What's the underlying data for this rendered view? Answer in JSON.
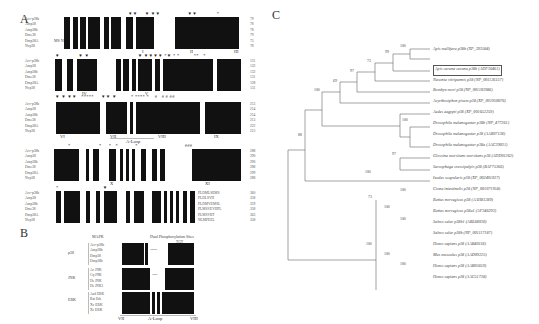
{
  "panels": {
    "A": {
      "letter": "A",
      "blocks": [
        {
          "sequences": [
            "Acc-p38b",
            "Amp38",
            "Amp38b",
            "Dme38",
            "Dmp38A",
            "Nvp38"
          ],
          "end_positions": [
            "79",
            "78",
            "78",
            "79",
            "75",
            "78"
          ],
          "motifs": [
            "I",
            "II",
            "III"
          ],
          "prefix_text": "MS NK"
        },
        {
          "sequences": [
            "Acc-p38b",
            "Amp38",
            "Amp38b",
            "Dme38",
            "Dmp38A",
            "Nvp38"
          ],
          "end_positions": [
            "131",
            "132",
            "132",
            "131",
            "128",
            "131"
          ],
          "motifs": [
            "IV",
            "V"
          ]
        },
        {
          "sequences": [
            "Acc-p38b",
            "Amp38",
            "Amp38b",
            "Dme38",
            "Dmp38A",
            "Nvp38"
          ],
          "end_positions": [
            "213",
            "214",
            "214",
            "213",
            "222",
            "213"
          ],
          "motifs": [
            "VI",
            "VII",
            "A-Loop",
            "VIII",
            "IX"
          ]
        },
        {
          "sequences": [
            "Acc-p38b",
            "Amp38",
            "Amp38b",
            "Dme38",
            "Dmp38A",
            "Nvp38"
          ],
          "end_positions": [
            "288",
            "290",
            "290",
            "288",
            "299",
            "288"
          ],
          "motifs": [
            "X",
            "XI"
          ]
        },
        {
          "sequences": [
            "Acc-p38b",
            "Amp38",
            "Amp38b",
            "Dme38",
            "Dmp38A",
            "Nvp38"
          ],
          "end_positions": [
            "360",
            "358",
            "359",
            "358",
            "363",
            "358"
          ],
          "tail_text": [
            "PLDMLSEMS",
            "PLDLSVH",
            "PLDMVEMSL",
            "PLMSVEVHPL",
            "PLMSVRT",
            "NLMPEEL"
          ]
        }
      ]
    },
    "B": {
      "letter": "B",
      "header_left": "MAPK",
      "header_right": "Dual Phosphorylation Sites",
      "motif_marker": "TGY",
      "groups": [
        {
          "name": "p38",
          "members": [
            "Acc-p38b",
            "Amp38b",
            "Dmp38",
            "Dmp38b"
          ]
        },
        {
          "name": "JNK",
          "members": [
            "Ac JNK",
            "Cq JNK",
            "Hs JNK",
            "Hs JNK1"
          ]
        },
        {
          "name": "ERK",
          "members": [
            "Aad ERK",
            "Rat Erk",
            "Xv ERK",
            "Xc ERK"
          ]
        }
      ],
      "bottom_labels": [
        "VII",
        "A-Loop",
        "VIII"
      ]
    },
    "C": {
      "letter": "C",
      "leaves": [
        {
          "label": "Apis mellifera p38b (XP_393584)",
          "highlight": false
        },
        {
          "label": "Apis cerana cerana p38b (ADF36461)",
          "highlight": true
        },
        {
          "label": "Nasonia vitripennis p38 (NP_001136157)",
          "highlight": false
        },
        {
          "label": "Bombyx mori p38 (NP_001103986)",
          "highlight": false
        },
        {
          "label": "Acyrthosiphon pisum p38 (XP_001950076)",
          "highlight": false
        },
        {
          "label": "Aedes aegypti p38 (XP_001652259)",
          "highlight": false
        },
        {
          "label": "Drosophila melanogaster p38b (NP_477361)",
          "highlight": false
        },
        {
          "label": "Drosophila melanogaster p38 (AAB97138)",
          "highlight": false
        },
        {
          "label": "Drosophila melanogaster p38a (AAC39031)",
          "highlight": false
        },
        {
          "label": "Glossina morsitans morsitans p38 (ADD01362)",
          "highlight": false
        },
        {
          "label": "Sarcophaga crassipalpis p38 (BAF75366)",
          "highlight": false
        },
        {
          "label": "Ixodes scapularis p38 (XP_002401037)",
          "highlight": false
        },
        {
          "label": "Ciona intestinalis p38 (NP_001071958)",
          "highlight": false
        },
        {
          "label": "Rattus norvegicus p38 (AAH81289)",
          "highlight": false
        },
        {
          "label": "Rattus norvegicus p38a1 (AF346293)",
          "highlight": false
        },
        {
          "label": "Salmo salar p38b1 (ABL68030)",
          "highlight": false
        },
        {
          "label": "Salmo salar p38b (NP_001117187)",
          "highlight": false
        },
        {
          "label": "Homo sapiens p38 (AAB40118)",
          "highlight": false
        },
        {
          "label": "Mus musculus p38 (AAD09225)",
          "highlight": false
        },
        {
          "label": "Homo sapiens p38 (AAB05659)",
          "highlight": false
        },
        {
          "label": "Homo sapiens p38 (AAC51738)",
          "highlight": false
        }
      ],
      "bootstrap": [
        "100",
        "99",
        "73",
        "97",
        "69",
        "100",
        "100",
        "97",
        "88",
        "100",
        "73",
        "100",
        "100",
        "100",
        "100",
        "100",
        "100"
      ]
    }
  }
}
